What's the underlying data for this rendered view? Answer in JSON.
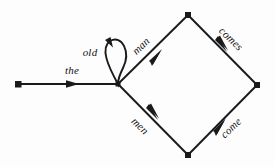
{
  "diagram": {
    "type": "transition-network",
    "background_color": "#fdfdfd",
    "stroke_color": "#1a1a1a",
    "label_color": "#141414",
    "nodes": [
      {
        "id": "n0",
        "name": "start-node",
        "x": 18,
        "y": 84,
        "shape": "square-dot"
      },
      {
        "id": "n1",
        "name": "hub-node",
        "x": 118,
        "y": 84,
        "shape": "point"
      },
      {
        "id": "n2",
        "name": "top-node",
        "x": 188,
        "y": 15,
        "shape": "square-dot"
      },
      {
        "id": "n3",
        "name": "right-node",
        "x": 257,
        "y": 85,
        "shape": "square-dot"
      },
      {
        "id": "n4",
        "name": "bottom-node",
        "x": 188,
        "y": 155,
        "shape": "square-dot"
      }
    ],
    "edges": [
      {
        "id": "e-the",
        "label": "the",
        "from": "n0",
        "to": "n1",
        "label_x": 72,
        "label_y": 70,
        "label_rotation": 0
      },
      {
        "id": "e-old",
        "label": "old",
        "from": "n1",
        "to": "n1",
        "label_x": 90,
        "label_y": 52,
        "label_rotation": 0,
        "self_loop": true
      },
      {
        "id": "e-man",
        "label": "man",
        "from": "n1",
        "to": "n2",
        "label_x": 141,
        "label_y": 46,
        "label_rotation": -44
      },
      {
        "id": "e-men",
        "label": "men",
        "from": "n1",
        "to": "n4",
        "label_x": 140,
        "label_y": 126,
        "label_rotation": 44
      },
      {
        "id": "e-comes",
        "label": "comes",
        "from": "n2",
        "to": "n3",
        "label_x": 231,
        "label_y": 39,
        "label_rotation": 44
      },
      {
        "id": "e-come",
        "label": "come",
        "from": "n4",
        "to": "n3",
        "label_x": 231,
        "label_y": 128,
        "label_rotation": -44
      }
    ]
  }
}
